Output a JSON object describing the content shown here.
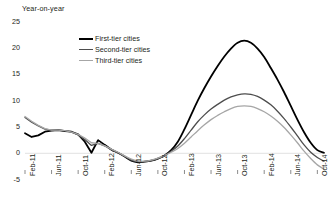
{
  "chart_data": {
    "type": "line",
    "title": "Year-on-year",
    "xlabel": "",
    "ylabel": "Year-on-year",
    "ylim": [
      -5,
      25
    ],
    "y_ticks": [
      "25",
      "20",
      "15",
      "10",
      "5",
      "0",
      "-5"
    ],
    "y_tick_values": [
      25,
      20,
      15,
      10,
      5,
      0,
      -5
    ],
    "grid": false,
    "zero_line": true,
    "legend_position": "upper-center-left",
    "x_tick_labels": [
      "Feb-11",
      "Jun-11",
      "Oct-11",
      "Feb-12",
      "Jun-12",
      "Oct-12",
      "Feb-13",
      "Jun-13",
      "Oct-13",
      "Feb-14",
      "Jun-14",
      "Oct-14"
    ],
    "x": [
      "Feb-11",
      "Mar-11",
      "Apr-11",
      "May-11",
      "Jun-11",
      "Jul-11",
      "Aug-11",
      "Sep-11",
      "Oct-11",
      "Nov-11",
      "Dec-11",
      "Jan-12",
      "Feb-12",
      "Mar-12",
      "Apr-12",
      "May-12",
      "Jun-12",
      "Jul-12",
      "Aug-12",
      "Sep-12",
      "Oct-12",
      "Nov-12",
      "Dec-12",
      "Jan-13",
      "Feb-13",
      "Mar-13",
      "Apr-13",
      "May-13",
      "Jun-13",
      "Jul-13",
      "Aug-13",
      "Sep-13",
      "Oct-13",
      "Nov-13",
      "Dec-13",
      "Jan-14",
      "Feb-14",
      "Mar-14",
      "Apr-14",
      "May-14",
      "Jun-14",
      "Jul-14",
      "Aug-14",
      "Sep-14",
      "Oct-14",
      "Nov-14"
    ],
    "series": [
      {
        "name": "First-tier cities",
        "color": "#000000",
        "width": 1.8,
        "values": [
          3.8,
          3.1,
          3.4,
          4.1,
          4.3,
          4.4,
          4.2,
          4.1,
          3.6,
          2.2,
          0.1,
          2.5,
          1.6,
          0.7,
          0.1,
          -0.6,
          -1.4,
          -1.7,
          -1.6,
          -1.4,
          -1.0,
          -0.4,
          0.6,
          2.2,
          4.6,
          7.3,
          10.0,
          12.4,
          14.6,
          16.6,
          18.4,
          19.9,
          21.0,
          21.4,
          21.0,
          19.9,
          18.3,
          16.2,
          14.0,
          11.6,
          9.0,
          6.4,
          4.0,
          2.0,
          0.6,
          0.1
        ]
      },
      {
        "name": "Second-tier cities",
        "color": "#4d4d4d",
        "width": 1.3,
        "values": [
          6.8,
          5.9,
          5.2,
          4.6,
          4.4,
          4.4,
          4.3,
          4.0,
          3.5,
          2.6,
          1.5,
          1.9,
          1.4,
          0.7,
          0.1,
          -0.6,
          -1.3,
          -1.6,
          -1.6,
          -1.4,
          -1.0,
          -0.4,
          0.4,
          1.4,
          2.8,
          4.4,
          6.0,
          7.3,
          8.4,
          9.3,
          10.1,
          10.7,
          11.1,
          11.3,
          11.2,
          10.8,
          10.1,
          9.2,
          8.0,
          6.6,
          5.0,
          3.3,
          1.6,
          0.2,
          -0.8,
          -1.5
        ]
      },
      {
        "name": "Third-tier cities",
        "color": "#a6a6a6",
        "width": 1.3,
        "values": [
          7.0,
          6.1,
          5.3,
          4.7,
          4.4,
          4.4,
          4.3,
          4.0,
          3.6,
          2.9,
          2.0,
          1.9,
          1.4,
          0.8,
          0.2,
          -0.5,
          -1.1,
          -1.5,
          -1.5,
          -1.3,
          -0.9,
          -0.4,
          0.2,
          0.9,
          1.9,
          3.1,
          4.3,
          5.4,
          6.4,
          7.2,
          7.9,
          8.5,
          8.9,
          9.0,
          8.9,
          8.5,
          7.9,
          7.1,
          6.1,
          4.9,
          3.5,
          2.0,
          0.4,
          -1.0,
          -2.2,
          -3.0
        ]
      }
    ]
  }
}
